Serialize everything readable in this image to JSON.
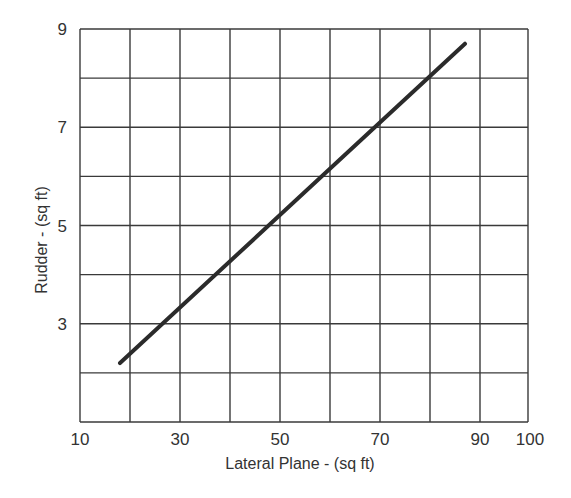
{
  "chart_data": {
    "type": "line",
    "title": "",
    "xlabel": "Lateral Plane - (sq ft)",
    "ylabel": "Rudder - (sq ft)",
    "xlim": [
      10,
      100
    ],
    "ylim": [
      1,
      9
    ],
    "x_ticks": [
      10,
      30,
      50,
      70,
      90,
      100
    ],
    "y_ticks": [
      3,
      5,
      7,
      9
    ],
    "x_gridlines": [
      10,
      20,
      30,
      40,
      50,
      60,
      70,
      80,
      90,
      100
    ],
    "y_gridlines": [
      1,
      2,
      3,
      4,
      5,
      6,
      7,
      8,
      9
    ],
    "grid": true,
    "legend": null,
    "series": [
      {
        "name": "Rudder area vs lateral plane",
        "color": "#2b2b2b",
        "x": [
          18,
          87
        ],
        "y": [
          2.2,
          8.7
        ]
      }
    ]
  },
  "colors": {
    "grid": "#3a3a3a",
    "line": "#2b2b2b",
    "text": "#333333",
    "background": "#ffffff"
  }
}
